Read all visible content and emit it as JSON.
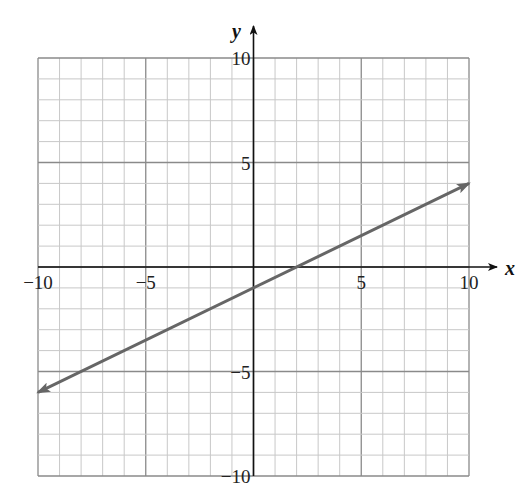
{
  "chart_data": {
    "type": "line",
    "title": "",
    "xlabel": "x",
    "ylabel": "y",
    "xlim": [
      -10,
      10
    ],
    "ylim": [
      -10,
      10
    ],
    "grid": true,
    "grid_minor_step": 1,
    "grid_major_step": 5,
    "x_ticks": [
      -10,
      -5,
      5,
      10
    ],
    "y_ticks": [
      10,
      5,
      -5,
      -10
    ],
    "x_tick_labels": [
      "−10",
      "−5",
      "5",
      "10"
    ],
    "y_tick_labels": [
      "10",
      "5",
      "−5",
      "−10"
    ],
    "series": [
      {
        "name": "line",
        "equation": "y = 0.5x - 1",
        "slope": 0.5,
        "intercept": -1,
        "x": [
          -10,
          10
        ],
        "y": [
          -6,
          4
        ],
        "arrows_both_ends": true,
        "color": "#666666"
      }
    ],
    "legend": null
  },
  "colors": {
    "grid_minor": "#c8c8c8",
    "grid_major": "#8a8a8a",
    "axis": "#111111",
    "line": "#666666"
  }
}
